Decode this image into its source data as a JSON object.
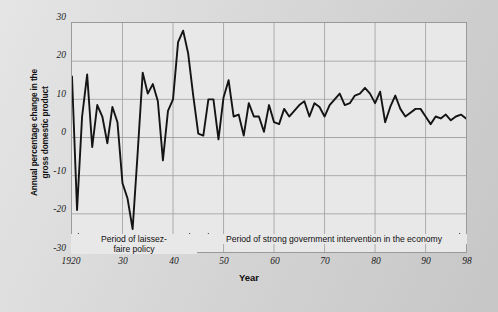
{
  "chart_data": {
    "type": "line",
    "title": "",
    "xlabel": "Year",
    "ylabel": "Annual percentage change in the gross domestic product",
    "ylabel_line1": "Annual percentage change in the",
    "ylabel_line2": "gross domestic product",
    "xlim": [
      1920,
      1998
    ],
    "ylim": [
      -30,
      30
    ],
    "yticks": [
      30,
      20,
      10,
      0,
      -10,
      -20,
      -30
    ],
    "ytick_labels": [
      "30",
      "20",
      "10",
      "0",
      "-10",
      "-20",
      "-30"
    ],
    "xticks": [
      1920,
      1930,
      1940,
      1950,
      1960,
      1970,
      1980,
      1990,
      1998
    ],
    "xtick_labels": [
      "1920",
      "30",
      "40",
      "50",
      "60",
      "70",
      "80",
      "90",
      "98"
    ],
    "grid": true,
    "legend": "none",
    "line_color": "#141414",
    "plot_bg": "#e8e8e8",
    "x": [
      1920,
      1921,
      1922,
      1923,
      1924,
      1925,
      1926,
      1927,
      1928,
      1929,
      1930,
      1931,
      1932,
      1933,
      1934,
      1935,
      1936,
      1937,
      1938,
      1939,
      1940,
      1941,
      1942,
      1943,
      1944,
      1945,
      1946,
      1947,
      1948,
      1949,
      1950,
      1951,
      1952,
      1953,
      1954,
      1955,
      1956,
      1957,
      1958,
      1959,
      1960,
      1961,
      1962,
      1963,
      1964,
      1965,
      1966,
      1967,
      1968,
      1969,
      1970,
      1971,
      1972,
      1973,
      1974,
      1975,
      1976,
      1977,
      1978,
      1979,
      1980,
      1981,
      1982,
      1983,
      1984,
      1985,
      1986,
      1987,
      1988,
      1989,
      1990,
      1991,
      1992,
      1993,
      1994,
      1995,
      1996,
      1997,
      1998
    ],
    "values": [
      16,
      -19,
      5.5,
      16.5,
      -2.5,
      8.5,
      5.5,
      -1.5,
      8,
      4,
      -12,
      -16,
      -24,
      -4,
      17,
      11.5,
      14,
      9.5,
      -6,
      7,
      10,
      25,
      28,
      22,
      11,
      1,
      0.5,
      10,
      10,
      -0.5,
      10.5,
      15,
      5.5,
      6,
      0.5,
      9,
      5.5,
      5.5,
      1.5,
      8.5,
      4,
      3.5,
      7.5,
      5.5,
      7,
      8.5,
      9.5,
      5.5,
      9,
      8,
      5.5,
      8.5,
      10,
      11.5,
      8.5,
      9,
      11,
      11.5,
      13,
      11.5,
      9,
      12,
      4,
      8,
      11,
      7.5,
      5.5,
      6.5,
      7.5,
      7.5,
      5.5,
      3.5,
      5.5,
      5,
      6,
      4.5,
      5.5,
      6,
      5
    ]
  },
  "annotations": [
    {
      "id": "band-left",
      "label_line1": "Period of laissez-",
      "label_line2": "faire policy",
      "x_start": 1920,
      "x_end": 1944
    },
    {
      "id": "band-right",
      "label_line1": "Period of strong government intervention in the economy",
      "label_line2": "",
      "x_start": 1945,
      "x_end": 1998
    }
  ]
}
